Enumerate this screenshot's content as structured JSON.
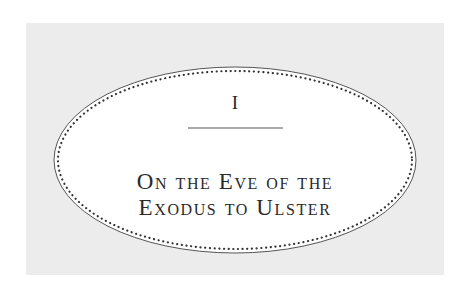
{
  "chapter": {
    "number": "I",
    "title_lines": [
      "On the Eve of the",
      "Exodus to Ulster"
    ]
  },
  "colors": {
    "background": "#ffffff",
    "panel": "#ececec",
    "plate": "#ffffff",
    "ink": "#2a2a2a"
  }
}
